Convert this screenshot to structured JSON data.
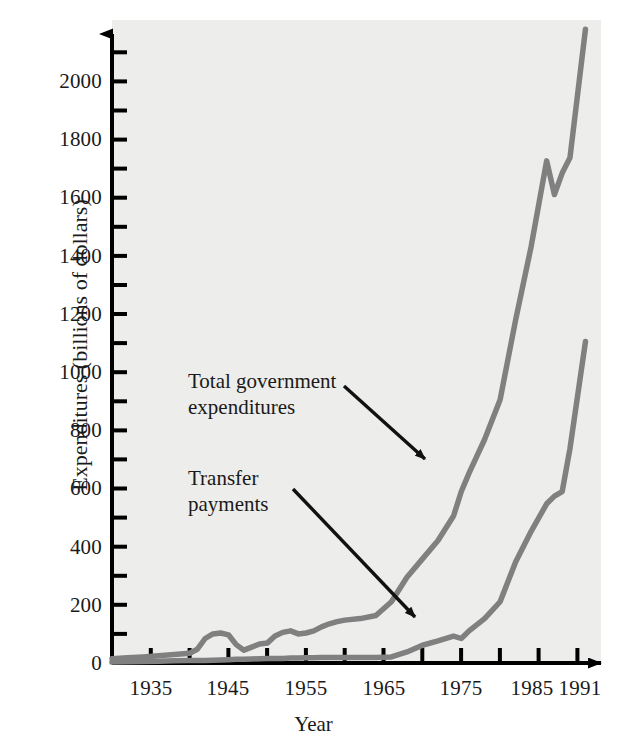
{
  "chart_data": {
    "type": "line",
    "title": "",
    "xlabel": "Year",
    "ylabel": "Expenditures (billions of dollars)",
    "xlim": [
      1930,
      1993
    ],
    "ylim": [
      0,
      2100
    ],
    "grid": false,
    "legend_position": "inline-annotations",
    "x_tick_labels": [
      "1935",
      "1945",
      "1955",
      "1965",
      "1975",
      "1985",
      "1991"
    ],
    "x_tick_label_values": [
      1935,
      1945,
      1955,
      1965,
      1975,
      1985,
      1991
    ],
    "x_minor_tick_values": [
      1930,
      1935,
      1940,
      1945,
      1950,
      1955,
      1960,
      1965,
      1970,
      1975,
      1980,
      1985,
      1990
    ],
    "y_tick_labels": [
      "0",
      "200",
      "400",
      "600",
      "800",
      "1000",
      "1200",
      "1400",
      "1600",
      "1800",
      "2000"
    ],
    "y_tick_label_values": [
      0,
      200,
      400,
      600,
      800,
      1000,
      1200,
      1400,
      1600,
      1800,
      2000
    ],
    "y_minor_tick_values": [
      0,
      100,
      200,
      300,
      400,
      500,
      600,
      700,
      800,
      900,
      1000,
      1100,
      1200,
      1300,
      1400,
      1500,
      1600,
      1700,
      1800,
      1900,
      2000,
      2100
    ],
    "line_color": "#808080",
    "axis_color": "#000000",
    "plot_background": "#ededeb",
    "x": [
      1930,
      1932,
      1934,
      1936,
      1938,
      1940,
      1941,
      1942,
      1943,
      1944,
      1945,
      1946,
      1947,
      1948,
      1949,
      1950,
      1951,
      1952,
      1953,
      1954,
      1955,
      1956,
      1957,
      1958,
      1959,
      1960,
      1962,
      1964,
      1966,
      1968,
      1970,
      1972,
      1974,
      1975,
      1976,
      1978,
      1980,
      1982,
      1984,
      1986,
      1987,
      1988,
      1989,
      1991
    ],
    "series": [
      {
        "name": "Total government expenditures",
        "values": [
          14,
          17,
          20,
          24,
          28,
          32,
          45,
          80,
          95,
          98,
          92,
          60,
          42,
          52,
          62,
          65,
          88,
          100,
          105,
          95,
          98,
          105,
          118,
          128,
          135,
          140,
          145,
          155,
          200,
          280,
          340,
          400,
          480,
          560,
          620,
          730,
          860,
          1120,
          1360,
          1640,
          1530,
          1600,
          1650,
          2070
        ]
      },
      {
        "name": "Transfer payments",
        "values": [
          3,
          4,
          5,
          6,
          7,
          8,
          8,
          8,
          9,
          10,
          11,
          12,
          12,
          13,
          14,
          15,
          15,
          15,
          16,
          16,
          17,
          17,
          18,
          18,
          18,
          18,
          18,
          18,
          20,
          36,
          58,
          72,
          88,
          80,
          105,
          145,
          200,
          330,
          430,
          520,
          545,
          560,
          700,
          1050
        ]
      }
    ],
    "annotations": [
      {
        "text": "Total government\nexpenditures",
        "points_to": "total-government-expenditures"
      },
      {
        "text": "Transfer\npayments",
        "points_to": "transfer-payments"
      }
    ]
  }
}
